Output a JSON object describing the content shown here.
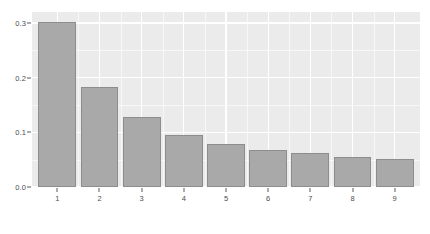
{
  "chart_data": {
    "type": "bar",
    "title": "",
    "subtitle": "",
    "xlabel": "",
    "ylabel": "",
    "categories": [
      "1",
      "2",
      "3",
      "4",
      "5",
      "6",
      "7",
      "8",
      "9"
    ],
    "values": [
      0.301,
      0.182,
      0.128,
      0.095,
      0.079,
      0.068,
      0.062,
      0.055,
      0.051
    ],
    "series": [
      {
        "name": "proportion",
        "values": [
          0.301,
          0.182,
          0.128,
          0.095,
          0.079,
          0.068,
          0.062,
          0.055,
          0.051
        ]
      }
    ],
    "ylim": [
      0.0,
      0.32
    ],
    "xlim": [
      0.4,
      9.6
    ],
    "y_ticks": [
      0.0,
      0.1,
      0.2,
      0.3
    ],
    "y_tick_labels": [
      "0.0",
      "0.1",
      "0.2",
      "0.3"
    ],
    "y_minor_ticks": [
      0.05,
      0.15,
      0.25
    ],
    "x_ticks": [
      1,
      2,
      3,
      4,
      5,
      6,
      7,
      8,
      9
    ],
    "x_tick_labels": [
      "1",
      "2",
      "3",
      "4",
      "5",
      "6",
      "7",
      "8",
      "9"
    ],
    "grid": true,
    "grid_color": "#ffffff",
    "legend": null,
    "legend_position": "none",
    "annotations": [],
    "bar_fill_color": "#a9a9a9",
    "bar_border_color": "#8d8d8d",
    "panel_background": "#ebebeb",
    "figure_background": "#ffffff",
    "axis_text_color": "#4d4d4d"
  }
}
